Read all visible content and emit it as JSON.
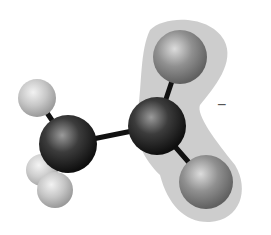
{
  "diagram": {
    "charge_label": "−",
    "colors": {
      "background": "#ffffff",
      "charge_cloud": "#c8c8c8",
      "carbon": "#3a3a3a",
      "oxygen": "#8c8c8c",
      "hydrogen": "#c4c4c4",
      "bond": "#111111"
    },
    "atoms": [
      {
        "id": "H1",
        "element": "H",
        "cx": 37,
        "cy": 98,
        "r": 19
      },
      {
        "id": "H2",
        "element": "H",
        "cx": 42,
        "cy": 170,
        "r": 16
      },
      {
        "id": "H3",
        "element": "H",
        "cx": 55,
        "cy": 190,
        "r": 18
      },
      {
        "id": "C1",
        "element": "C",
        "cx": 68,
        "cy": 144,
        "r": 29
      },
      {
        "id": "C2",
        "element": "C",
        "cx": 157,
        "cy": 126,
        "r": 29
      },
      {
        "id": "O1",
        "element": "O",
        "cx": 180,
        "cy": 57,
        "r": 27
      },
      {
        "id": "O2",
        "element": "O",
        "cx": 206,
        "cy": 182,
        "r": 27
      }
    ]
  }
}
